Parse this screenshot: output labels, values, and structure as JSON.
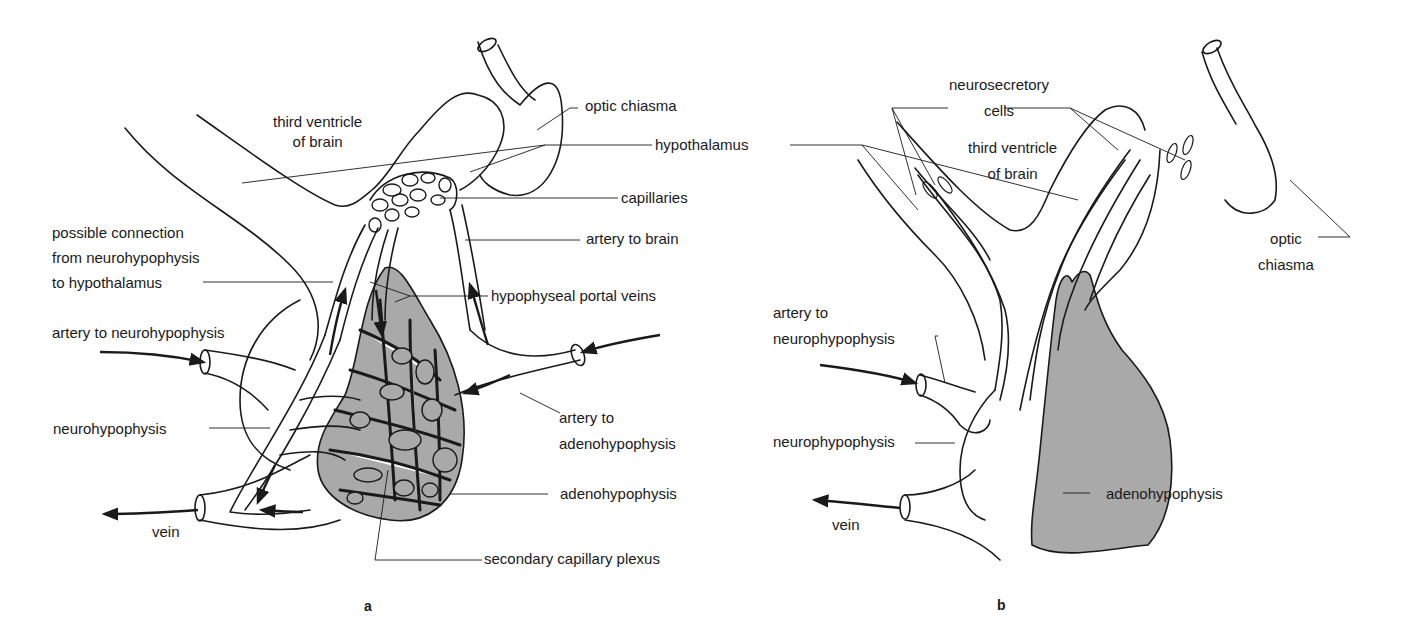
{
  "figure": {
    "panel_a": {
      "letter": "a",
      "labels": {
        "third_ventricle": "third ventricle\nof brain",
        "optic_chiasma": "optic chiasma",
        "hypothalamus": "hypothalamus",
        "capillaries": "capillaries",
        "artery_to_brain": "artery to brain",
        "possible_connection": "possible connection\nfrom neurohypophysis\nto hypothalamus",
        "hypophyseal_portal_veins": "hypophyseal portal veins",
        "artery_to_neurohypophysis": "artery to neurohypophysis",
        "neurohypophysis": "neurohypophysis",
        "artery_to_adenohypophysis": "artery to\nadenohypophysis",
        "adenohypophysis": "adenohypophysis",
        "vein": "vein",
        "secondary_capillary_plexus": "secondary capillary plexus"
      }
    },
    "panel_b": {
      "letter": "b",
      "labels": {
        "neurosecretory_cells": "neurosecretory\ncells",
        "third_ventricle": "third ventricle\nof brain",
        "optic_chiasma": "optic\nchiasma",
        "artery_to_neurophypophysis": "artery to\nneurophypophysis",
        "neurophypophysis": "neurophypophysis",
        "vein": "vein",
        "adenohypophysis": "adenohypophysis"
      }
    },
    "colors": {
      "line": "#1a1a1a",
      "shading": "#a9a9a9",
      "background": "#ffffff"
    }
  }
}
